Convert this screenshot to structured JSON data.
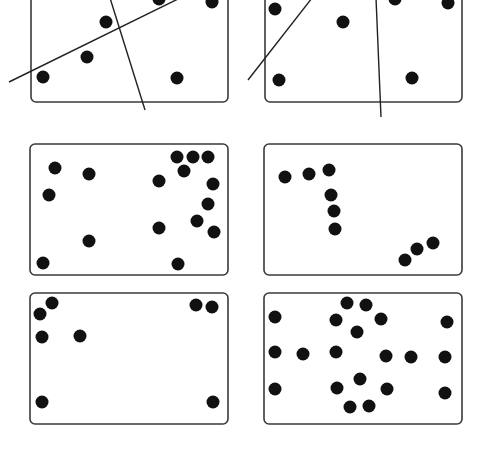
{
  "figure": {
    "width": 484,
    "height": 449,
    "colors": {
      "background": "#ffffff",
      "panel_border": "#3a3a3a",
      "dot": "#111111",
      "line": "#222222"
    },
    "dot_radius": 6.5,
    "panels": [
      {
        "id": "top-left",
        "box": {
          "x": 31,
          "y": -12,
          "w": 197,
          "h": 114,
          "r": 5
        },
        "dots": [
          [
            43,
            77
          ],
          [
            87,
            57
          ],
          [
            106,
            22
          ],
          [
            159,
            -1
          ],
          [
            212,
            2
          ],
          [
            177,
            78
          ]
        ],
        "lines": [
          [
            9,
            82,
            180,
            -2
          ],
          [
            110,
            -2,
            145,
            110
          ]
        ]
      },
      {
        "id": "top-right",
        "box": {
          "x": 265,
          "y": -12,
          "w": 197,
          "h": 114,
          "r": 5
        },
        "dots": [
          [
            275,
            9
          ],
          [
            343,
            22
          ],
          [
            279,
            80
          ],
          [
            395,
            -1
          ],
          [
            448,
            3
          ],
          [
            412,
            78
          ]
        ],
        "lines": [
          [
            248,
            80,
            312,
            -2
          ],
          [
            376,
            -2,
            381,
            117
          ]
        ]
      },
      {
        "id": "middle-left",
        "box": {
          "x": 30,
          "y": 144,
          "w": 198,
          "h": 131,
          "r": 5
        },
        "dots": [
          [
            55,
            168
          ],
          [
            89,
            174
          ],
          [
            49,
            195
          ],
          [
            159,
            181
          ],
          [
            177,
            157
          ],
          [
            193,
            157
          ],
          [
            208,
            157
          ],
          [
            184,
            171
          ],
          [
            213,
            184
          ],
          [
            208,
            204
          ],
          [
            197,
            221
          ],
          [
            159,
            228
          ],
          [
            214,
            232
          ],
          [
            89,
            241
          ],
          [
            43,
            263
          ],
          [
            178,
            264
          ]
        ],
        "lines": []
      },
      {
        "id": "middle-right",
        "box": {
          "x": 264,
          "y": 144,
          "w": 198,
          "h": 131,
          "r": 5
        },
        "dots": [
          [
            285,
            177
          ],
          [
            309,
            174
          ],
          [
            329,
            170
          ],
          [
            331,
            195
          ],
          [
            334,
            211
          ],
          [
            335,
            229
          ],
          [
            405,
            260
          ],
          [
            417,
            249
          ],
          [
            433,
            243
          ]
        ],
        "lines": []
      },
      {
        "id": "bottom-left",
        "box": {
          "x": 30,
          "y": 293,
          "w": 198,
          "h": 131,
          "r": 5
        },
        "dots": [
          [
            52,
            303
          ],
          [
            40,
            314
          ],
          [
            42,
            337
          ],
          [
            80,
            336
          ],
          [
            196,
            305
          ],
          [
            212,
            307
          ],
          [
            42,
            402
          ],
          [
            213,
            402
          ]
        ],
        "lines": []
      },
      {
        "id": "bottom-right",
        "box": {
          "x": 264,
          "y": 293,
          "w": 198,
          "h": 131,
          "r": 5
        },
        "dots": [
          [
            275,
            317
          ],
          [
            347,
            303
          ],
          [
            366,
            305
          ],
          [
            336,
            320
          ],
          [
            381,
            319
          ],
          [
            357,
            332
          ],
          [
            447,
            322
          ],
          [
            275,
            352
          ],
          [
            303,
            354
          ],
          [
            336,
            352
          ],
          [
            386,
            356
          ],
          [
            411,
            357
          ],
          [
            445,
            357
          ],
          [
            360,
            379
          ],
          [
            337,
            388
          ],
          [
            387,
            389
          ],
          [
            275,
            389
          ],
          [
            445,
            393
          ],
          [
            350,
            407
          ],
          [
            369,
            406
          ]
        ],
        "lines": []
      }
    ]
  }
}
